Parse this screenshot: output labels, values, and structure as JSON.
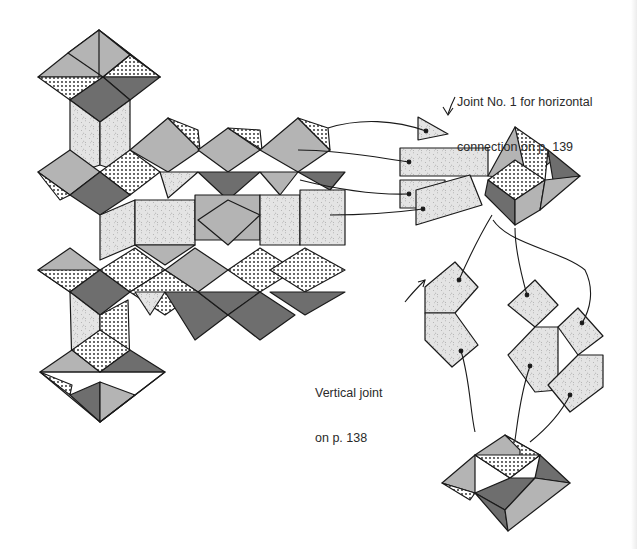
{
  "figure": {
    "type": "origami assembly diagram",
    "palette": {
      "light_gray": "#b4b4b4",
      "dark_gray": "#6e6e6e",
      "dotted": "#ffffff",
      "speckled": "#e2e2e2",
      "stroke": "#1a1a1a",
      "background": "#ffffff"
    }
  },
  "labels": {
    "horizontal_joint": {
      "line1": "Joint No. 1 for horizontal",
      "line2": "connection on p. 139"
    },
    "vertical_joint": {
      "line1": "Vertical joint",
      "line2": "on p. 138"
    }
  },
  "components": [
    {
      "id": "assembled-structure",
      "desc": "Large assembled modular structure with pyramidal units"
    },
    {
      "id": "horizontal-joint-unit",
      "desc": "Pyramid unit with four speckled flap pieces"
    },
    {
      "id": "vertical-joint-pieces",
      "desc": "Three folded speckled pieces with connecting arrows"
    },
    {
      "id": "bottom-pyramid-unit",
      "desc": "Pyramid unit receiving vertical joint pieces"
    }
  ]
}
